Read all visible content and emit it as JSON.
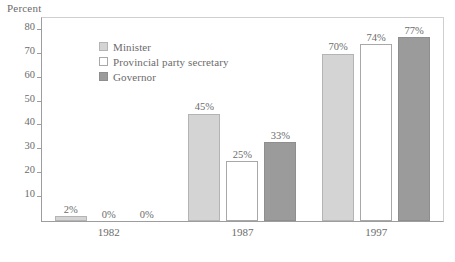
{
  "chart_data": {
    "type": "bar",
    "title": "",
    "xlabel": "",
    "ylabel": "Percent",
    "ylim": [
      0,
      85
    ],
    "yticks": [
      10,
      20,
      30,
      40,
      50,
      60,
      70,
      80
    ],
    "ytick_labels": [
      "10",
      "20",
      "30",
      "40",
      "50",
      "60",
      "70",
      "80"
    ],
    "grid": false,
    "legend_position": "inside-upper-left",
    "categories": [
      "1982",
      "1987",
      "1997"
    ],
    "series": [
      {
        "name": "Minister",
        "color": "#d4d4d4",
        "values": [
          2,
          45,
          70
        ],
        "labels": [
          "2%",
          "45%",
          "70%"
        ]
      },
      {
        "name": "Provincial party secretary",
        "color": "#ffffff",
        "values": [
          0,
          25,
          74
        ],
        "labels": [
          "0%",
          "25%",
          "74%"
        ]
      },
      {
        "name": "Governor",
        "color": "#9b9b9b",
        "values": [
          0,
          33,
          77
        ],
        "labels": [
          "0%",
          "33%",
          "77%"
        ]
      }
    ]
  },
  "axis": {
    "caption": "Percent"
  },
  "legend": {
    "items": [
      {
        "label": "Minister",
        "swatch": "minister"
      },
      {
        "label": "Provincial party secretary",
        "swatch": "secretary"
      },
      {
        "label": "Governor",
        "swatch": "governor"
      }
    ]
  }
}
